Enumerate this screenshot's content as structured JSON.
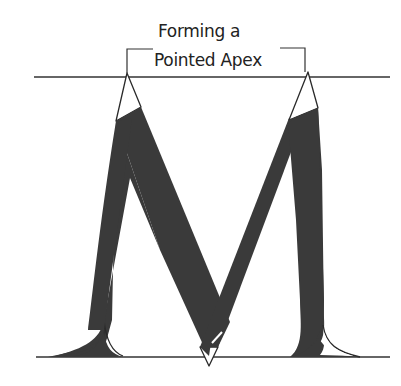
{
  "figure": {
    "title_line1": "Forming a",
    "title_line2": "Pointed Apex",
    "letter": "M",
    "colors": {
      "ink": "#3a3a3a",
      "outline": "#2a2a2a",
      "guide_line": "#333333",
      "background": "#ffffff"
    },
    "guides": {
      "top_line_y": 77,
      "baseline_y": 357,
      "x_start": 34,
      "x_end": 390
    }
  }
}
